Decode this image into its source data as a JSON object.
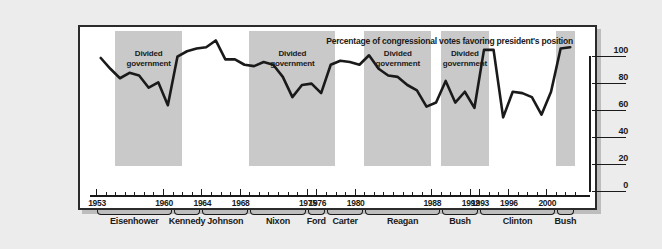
{
  "chart_data": {
    "type": "line",
    "title": "Percentage of congressional votes favoring president's position",
    "xlabel": "",
    "ylabel": "",
    "ylim": [
      0,
      100
    ],
    "xlim": [
      1953,
      2002
    ],
    "yticks": [
      0,
      20,
      40,
      60,
      80,
      100
    ],
    "grid": false,
    "legend": null,
    "year_ticks": [
      {
        "year": 1953,
        "label": "1953"
      },
      {
        "year": 1960,
        "label": "1960"
      },
      {
        "year": 1964,
        "label": "1964"
      },
      {
        "year": 1968,
        "label": "1968"
      },
      {
        "year": 1975,
        "label": "1975"
      },
      {
        "year": 1976,
        "label": "1976"
      },
      {
        "year": 1980,
        "label": "1980"
      },
      {
        "year": 1988,
        "label": "1988"
      },
      {
        "year": 1992,
        "label": "1992"
      },
      {
        "year": 1993,
        "label": "1993"
      },
      {
        "year": 1996,
        "label": "1996"
      },
      {
        "year": 2000,
        "label": "2000"
      }
    ],
    "presidents": [
      {
        "name": "Eisenhower",
        "start": 1953,
        "end": 1960
      },
      {
        "name": "Kennedy",
        "start": 1961,
        "end": 1963
      },
      {
        "name": "Johnson",
        "start": 1964,
        "end": 1968
      },
      {
        "name": "Nixon",
        "start": 1969,
        "end": 1974
      },
      {
        "name": "Ford",
        "start": 1975,
        "end": 1976
      },
      {
        "name": "Carter",
        "start": 1977,
        "end": 1980
      },
      {
        "name": "Reagan",
        "start": 1981,
        "end": 1988
      },
      {
        "name": "Bush",
        "start": 1989,
        "end": 1992
      },
      {
        "name": "Clinton",
        "start": 1993,
        "end": 2000
      },
      {
        "name": "Bush",
        "start": 2001,
        "end": 2002
      }
    ],
    "divided_government_label": "Divided\ngovernment",
    "divided_government_periods": [
      {
        "start": 1955,
        "end": 1961,
        "label_line1": "Divided",
        "label_line2": "government"
      },
      {
        "start": 1969,
        "end": 1977,
        "label_line1": "Divided",
        "label_line2": "government"
      },
      {
        "start": 1981,
        "end": 1987,
        "label_line1": "Divided",
        "label_line2": "government"
      },
      {
        "start": 1989,
        "end": 1993,
        "label_line1": "Divided",
        "label_line2": "government"
      },
      {
        "start": 2001,
        "end": 2002,
        "label_line1": "",
        "label_line2": ""
      }
    ],
    "x": [
      1953,
      1954,
      1955,
      1956,
      1957,
      1958,
      1959,
      1960,
      1961,
      1962,
      1963,
      1964,
      1965,
      1966,
      1967,
      1968,
      1969,
      1970,
      1971,
      1972,
      1973,
      1974,
      1975,
      1976,
      1977,
      1978,
      1979,
      1980,
      1981,
      1982,
      1983,
      1984,
      1985,
      1986,
      1987,
      1988,
      1989,
      1990,
      1991,
      1992,
      1993,
      1994,
      1995,
      1996,
      1997,
      1998,
      1999,
      2000,
      2001,
      2002
    ],
    "values": [
      80,
      72,
      65,
      69,
      67,
      58,
      62,
      45,
      81,
      85,
      87,
      88,
      93,
      79,
      79,
      75,
      74,
      77,
      75,
      66,
      51,
      60,
      61,
      54,
      75,
      78,
      77,
      75,
      82,
      72,
      67,
      66,
      60,
      56,
      44,
      47,
      63,
      47,
      55,
      43,
      86,
      86,
      36,
      55,
      54,
      51,
      38,
      55,
      87,
      88
    ],
    "line_color": "#1a1a1a",
    "band_color": "#c9c9c9",
    "plot_background": "#ffffff"
  }
}
